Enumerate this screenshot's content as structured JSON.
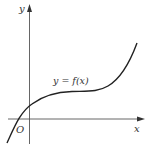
{
  "diagram": {
    "type": "function-graph",
    "colors": {
      "axis": "#555555",
      "curve": "#222222",
      "text": "#333333",
      "background": "#ffffff"
    },
    "labels": {
      "y_axis": "y",
      "x_axis": "x",
      "origin": "O",
      "curve": "y = f(x)"
    },
    "curve_description": "cubic-like increasing curve with a flat inflection region; crosses x-axis left of origin, crosses y-axis above origin"
  }
}
